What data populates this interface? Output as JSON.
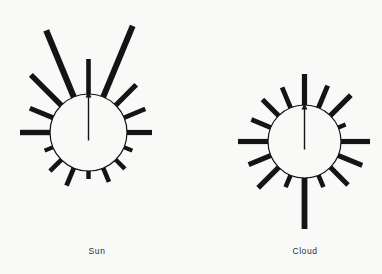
{
  "figure": {
    "type": "wind-rose-pair",
    "background_color": "#f9f9f7",
    "ink_color": "#141414"
  },
  "panels": [
    {
      "id": "sun",
      "caption": "Sun",
      "circle": {
        "cx": 88.5,
        "cy": 132.5,
        "r": 38.5,
        "stroke_width": 1.2,
        "fill": "none"
      },
      "needle": {
        "name": "north-arrow",
        "angle_deg": 0,
        "length": 41,
        "shaft_width": 1.4,
        "head_width": 6,
        "head_length": 6
      },
      "rays": [
        {
          "angle_deg": 0,
          "length": 36,
          "width": 4.6
        },
        {
          "angle_deg": 22.5,
          "length": 78,
          "width": 6.0
        },
        {
          "angle_deg": 45,
          "length": 30,
          "width": 5.2
        },
        {
          "angle_deg": 67.5,
          "length": 24,
          "width": 4.6
        },
        {
          "angle_deg": 90,
          "length": 26,
          "width": 5.2
        },
        {
          "angle_deg": 112.5,
          "length": 10,
          "width": 4.2
        },
        {
          "angle_deg": 135,
          "length": 14,
          "width": 4.4
        },
        {
          "angle_deg": 157.5,
          "length": 16,
          "width": 4.6
        },
        {
          "angle_deg": 180,
          "length": 9,
          "width": 4.4
        },
        {
          "angle_deg": 202.5,
          "length": 20,
          "width": 4.8
        },
        {
          "angle_deg": 225,
          "length": 17,
          "width": 4.6
        },
        {
          "angle_deg": 247.5,
          "length": 10,
          "width": 4.2
        },
        {
          "angle_deg": 270,
          "length": 31,
          "width": 5.4
        },
        {
          "angle_deg": 292.5,
          "length": 26,
          "width": 5.0
        },
        {
          "angle_deg": 315,
          "length": 44,
          "width": 5.6
        },
        {
          "angle_deg": 337.5,
          "length": 73,
          "width": 6.2
        }
      ]
    },
    {
      "id": "cloud",
      "caption": "Cloud",
      "circle": {
        "cx": 304.5,
        "cy": 141.5,
        "r": 36.5,
        "stroke_width": 1.2,
        "fill": "none"
      },
      "needle": {
        "name": "north-arrow",
        "angle_deg": 0,
        "length": 38,
        "shaft_width": 1.4,
        "head_width": 6,
        "head_length": 6
      },
      "rays": [
        {
          "angle_deg": 0,
          "length": 32,
          "width": 5.2
        },
        {
          "angle_deg": 22.5,
          "length": 25,
          "width": 5.0
        },
        {
          "angle_deg": 45,
          "length": 30,
          "width": 5.2
        },
        {
          "angle_deg": 67.5,
          "length": 9,
          "width": 4.4
        },
        {
          "angle_deg": 90,
          "length": 30,
          "width": 5.2
        },
        {
          "angle_deg": 112.5,
          "length": 27,
          "width": 5.0
        },
        {
          "angle_deg": 135,
          "length": 26,
          "width": 5.0
        },
        {
          "angle_deg": 157.5,
          "length": 14,
          "width": 4.6
        },
        {
          "angle_deg": 180,
          "length": 52,
          "width": 5.8
        },
        {
          "angle_deg": 202.5,
          "length": 14,
          "width": 4.6
        },
        {
          "angle_deg": 225,
          "length": 30,
          "width": 5.2
        },
        {
          "angle_deg": 247.5,
          "length": 25,
          "width": 5.0
        },
        {
          "angle_deg": 270,
          "length": 31,
          "width": 5.2
        },
        {
          "angle_deg": 292.5,
          "length": 22,
          "width": 4.8
        },
        {
          "angle_deg": 315,
          "length": 24,
          "width": 5.0
        },
        {
          "angle_deg": 337.5,
          "length": 23,
          "width": 4.8
        }
      ]
    }
  ]
}
